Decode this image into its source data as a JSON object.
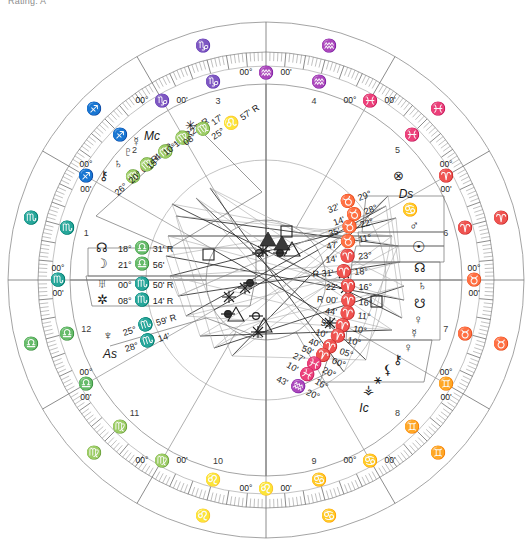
{
  "caption": "Rating: A",
  "chart": {
    "type": "natal-wheel",
    "house_system": "Equal / Whole sign (00° cusps)",
    "angles": [
      {
        "name": "Mc",
        "label": "Mc",
        "position": "top-left-quadrant"
      },
      {
        "name": "As",
        "label": "As",
        "position": "left-lower-quadrant"
      },
      {
        "name": "Ds",
        "label": "Ds",
        "position": "right-upper-quadrant"
      },
      {
        "name": "Ic",
        "label": "Ic",
        "position": "bottom-right-quadrant"
      }
    ],
    "zodiac_ring_signs": [
      {
        "glyph": "♌",
        "name": "Leo"
      },
      {
        "glyph": "♋",
        "name": "Cancer"
      },
      {
        "glyph": "♊",
        "name": "Gemini"
      },
      {
        "glyph": "♉",
        "name": "Taurus"
      },
      {
        "glyph": "♈",
        "name": "Aries"
      },
      {
        "glyph": "♓",
        "name": "Pisces"
      },
      {
        "glyph": "♒",
        "name": "Aquarius"
      },
      {
        "glyph": "♑",
        "name": "Capricorn"
      },
      {
        "glyph": "♐",
        "name": "Sagittarius"
      },
      {
        "glyph": "♏",
        "name": "Scorpio"
      },
      {
        "glyph": "♎",
        "name": "Libra"
      },
      {
        "glyph": "♍",
        "name": "Virgo"
      }
    ],
    "house_cusps": [
      {
        "house": 1,
        "text": "00° ♏ 00'",
        "deg": "00°",
        "sign": "♏",
        "min": "00'"
      },
      {
        "house": 2,
        "text": "00° ♐ 00'",
        "deg": "00°",
        "sign": "♐",
        "min": "00'"
      },
      {
        "house": 3,
        "text": "00° ♑ 00'",
        "deg": "00°",
        "sign": "♑",
        "min": "00'"
      },
      {
        "house": 4,
        "text": "00° ♒ 00'",
        "deg": "00°",
        "sign": "♒",
        "min": "00'"
      },
      {
        "house": 5,
        "text": "00° ♓ 00'",
        "deg": "00°",
        "sign": "♓",
        "min": "00'"
      },
      {
        "house": 6,
        "text": "00° ♈ 00'",
        "deg": "00°",
        "sign": "♈",
        "min": "00'"
      },
      {
        "house": 7,
        "text": "00° ♉ 00'",
        "deg": "00°",
        "sign": "♉",
        "min": "00'"
      },
      {
        "house": 8,
        "text": "00° ♊ 00'",
        "deg": "00°",
        "sign": "♊",
        "min": "00'"
      },
      {
        "house": 9,
        "text": "00° ♋ 00'",
        "deg": "00°",
        "sign": "♋",
        "min": "00'"
      },
      {
        "house": 10,
        "text": "00° ♌ 00'",
        "deg": "00°",
        "sign": "♌",
        "min": "00'"
      },
      {
        "house": 11,
        "text": "00° ♍ 00'",
        "deg": "00°",
        "sign": "♍",
        "min": "00'"
      },
      {
        "house": 12,
        "text": "00° ♎ 00'",
        "deg": "00°",
        "sign": "♎",
        "min": "00'"
      }
    ],
    "house_numbers": [
      "1",
      "2",
      "3",
      "4",
      "5",
      "6",
      "7",
      "8",
      "9",
      "10",
      "11",
      "12"
    ],
    "planets": [
      {
        "glyph": "⚷",
        "name": "chiron",
        "deg": "26°",
        "sign": "♍",
        "min": "05'",
        "retro": "R"
      },
      {
        "glyph": "♄",
        "name": "uranus",
        "deg": "20°",
        "sign": "♍",
        "min": "44'",
        "retro": "R"
      },
      {
        "glyph": "♇",
        "name": "pluto",
        "deg": "15°",
        "sign": "♍",
        "min": "17'",
        "retro": "R"
      },
      {
        "glyph": "☿",
        "name": "mercury",
        "deg": "10°",
        "sign": "♍",
        "min": "27'",
        "retro": "R"
      },
      {
        "glyph": "Mc",
        "name": "midheaven",
        "deg": "08°",
        "sign": "♍",
        "min": "17'",
        "retro": ""
      },
      {
        "glyph": "✳",
        "name": "vertex",
        "deg": "25°",
        "sign": "♌",
        "min": "57'",
        "retro": "R"
      },
      {
        "glyph": "☊",
        "name": "north-node",
        "deg": "18°",
        "sign": "♎",
        "min": "31'",
        "retro": "R"
      },
      {
        "glyph": "☽",
        "name": "moon",
        "deg": "21°",
        "sign": "♎",
        "min": "56'",
        "retro": ""
      },
      {
        "glyph": "♅",
        "name": "jupiter",
        "deg": "00°",
        "sign": "♏",
        "min": "50'",
        "retro": "R"
      },
      {
        "glyph": "✲",
        "name": "part-fortune",
        "deg": "08°",
        "sign": "♏",
        "min": "14'",
        "retro": "R"
      },
      {
        "glyph": "♆",
        "name": "neptune",
        "deg": "25°",
        "sign": "♏",
        "min": "59'",
        "retro": "R"
      },
      {
        "glyph": "As",
        "name": "ascendant",
        "deg": "28°",
        "sign": "♏",
        "min": "14'",
        "retro": ""
      },
      {
        "glyph": "⊗",
        "name": "fortune",
        "deg": "29°",
        "sign": "♉",
        "min": "32'",
        "retro": ""
      },
      {
        "glyph": "Ds",
        "name": "descendant",
        "deg": "28°",
        "sign": "♉",
        "min": "14'",
        "retro": ""
      },
      {
        "glyph": "♋",
        "name": "lilith",
        "deg": "22°",
        "sign": "♉",
        "min": "35'",
        "retro": ""
      },
      {
        "glyph": "♂",
        "name": "mars",
        "deg": "11°",
        "sign": "♉",
        "min": "47'",
        "retro": ""
      },
      {
        "glyph": "☉",
        "name": "sun",
        "deg": "23°",
        "sign": "♈",
        "min": "14'",
        "retro": ""
      },
      {
        "glyph": "☊",
        "name": "node-head",
        "deg": "18°",
        "sign": "♈",
        "min": "31'",
        "retro": "R"
      },
      {
        "glyph": "♄",
        "name": "saturn",
        "deg": "16°",
        "sign": "♈",
        "min": "22'",
        "retro": ""
      },
      {
        "glyph": "☋",
        "name": "south-node",
        "deg": "16°",
        "sign": "♈",
        "min": "00'",
        "retro": "R"
      },
      {
        "glyph": "♀",
        "name": "venus-alt",
        "deg": "11°",
        "sign": "♈",
        "min": "44'",
        "retro": ""
      },
      {
        "glyph": "☿",
        "name": "mercury-2",
        "deg": "10°",
        "sign": "♈",
        "min": "55'",
        "retro": ""
      },
      {
        "glyph": "♀",
        "name": "venus",
        "deg": "10°",
        "sign": "♈",
        "min": "10'",
        "retro": ""
      },
      {
        "glyph": "⚷",
        "name": "chiron-2",
        "deg": "05°",
        "sign": "♈",
        "min": "40'",
        "retro": ""
      },
      {
        "glyph": "⚸",
        "name": "eris",
        "deg": "00°",
        "sign": "♈",
        "min": "59'",
        "retro": ""
      },
      {
        "glyph": "⚹",
        "name": "sedna",
        "deg": "20°",
        "sign": "♓",
        "min": "27'",
        "retro": ""
      },
      {
        "glyph": "⚶",
        "name": "ceres",
        "deg": "16°",
        "sign": "♓",
        "min": "10'",
        "retro": ""
      },
      {
        "glyph": "Ic",
        "name": "imum-coeli",
        "deg": "20°",
        "sign": "♒",
        "min": "43'",
        "retro": ""
      }
    ],
    "aspect_symbols": [
      {
        "name": "square",
        "glyph": "□"
      },
      {
        "name": "trine-open",
        "glyph": "△"
      },
      {
        "name": "trine-fill",
        "glyph": "▲"
      },
      {
        "name": "sextile",
        "glyph": "✲"
      },
      {
        "name": "opposition",
        "glyph": "⚮"
      },
      {
        "name": "conjunction",
        "glyph": "☌"
      }
    ]
  }
}
